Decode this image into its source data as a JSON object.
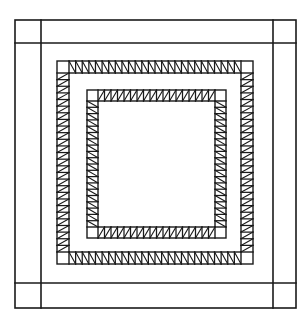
{
  "diagram": {
    "title": "Quilt block pattern",
    "canvas": {
      "width": 306,
      "height": 319,
      "background": "#ffffff"
    },
    "stroke_color": "#1a1a1a",
    "outer_frame": {
      "x": 15,
      "y": 20,
      "width": 281,
      "height": 288,
      "stroke_width": 1.6,
      "dividers": {
        "left_x": 41,
        "right_x": 273,
        "top_y": 43,
        "bottom_y": 283
      }
    },
    "hatched_bands": [
      {
        "name": "outer-sawtooth-border",
        "x": 57,
        "y": 61,
        "width": 196,
        "height": 203,
        "band": 12,
        "cell": 6.6,
        "stroke_width": 1.4,
        "diagonal": {
          "top": "backslash",
          "bottom": "backslash",
          "left": "slash",
          "right": "slash"
        }
      },
      {
        "name": "inner-sawtooth-border",
        "x": 87,
        "y": 90,
        "width": 139,
        "height": 148,
        "band": 11,
        "cell": 6.4,
        "stroke_width": 1.4,
        "diagonal": {
          "top": "slash",
          "bottom": "slash",
          "left": "backslash",
          "right": "backslash"
        }
      }
    ]
  }
}
